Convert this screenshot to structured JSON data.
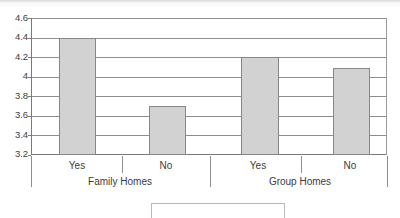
{
  "chart_data": {
    "type": "bar",
    "title": "",
    "subtitle": "",
    "xlabel": "",
    "ylabel": "",
    "categories": [
      "Yes",
      "No",
      "Yes",
      "No"
    ],
    "groups": [
      {
        "label": "Family Homes",
        "categories": [
          "Yes",
          "No"
        ],
        "values": [
          4.4,
          3.7
        ]
      },
      {
        "label": "Group Homes",
        "categories": [
          "Yes",
          "No"
        ],
        "values": [
          4.2,
          4.09
        ]
      }
    ],
    "values": [
      4.4,
      3.7,
      4.2,
      4.09
    ],
    "ylim": [
      3.2,
      4.6
    ],
    "ytick_values": [
      4.6,
      4.4,
      4.2,
      4.0,
      3.8,
      3.6,
      3.4,
      3.2
    ],
    "ytick_labels": [
      "4.6",
      "4.4",
      "4.2",
      "4",
      "3.8",
      "3.6",
      "3.4",
      "3.2"
    ],
    "ytick_step": 0.2,
    "grid": {
      "horizontal": true,
      "vertical": false
    },
    "legend": {
      "position": "bottom",
      "entries": []
    },
    "bar_fill_color": "#d2d2d2",
    "bar_border_color": "#878787",
    "gridline_color": "#8d8d8d",
    "axis_color": "#7a7a7a",
    "background_color": "#ffffff"
  },
  "bars": [
    {
      "label": "Yes",
      "group": "Family Homes",
      "value": 4.4,
      "value_text": "4.4"
    },
    {
      "label": "No",
      "group": "Family Homes",
      "value": 3.7,
      "value_text": "3.7"
    },
    {
      "label": "Yes",
      "group": "Group Homes",
      "value": 4.2,
      "value_text": "4.2"
    },
    {
      "label": "No",
      "group": "Group Homes",
      "value": 4.09,
      "value_text": "4.09"
    }
  ],
  "yaxis": {
    "t0": "4.6",
    "t1": "4.4",
    "t2": "4.2",
    "t3": "4",
    "t4": "3.8",
    "t5": "3.6",
    "t6": "3.4",
    "t7": "3.2"
  },
  "xaxis": {
    "c0": "Yes",
    "c1": "No",
    "c2": "Yes",
    "c3": "No",
    "g0": "Family Homes",
    "g1": "Group Homes"
  }
}
